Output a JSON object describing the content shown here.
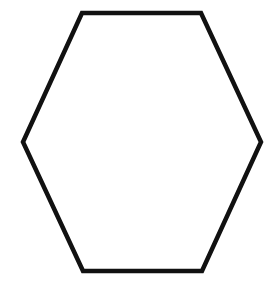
{
  "diagram": {
    "shape": "hexagon",
    "orientation": "flat-top",
    "stroke_color": "#111111",
    "fill_color": "#ffffff",
    "background_color": "#ffffff",
    "stroke_width": 4.5,
    "vertices": [
      [
        82,
        13
      ],
      [
        201,
        13
      ],
      [
        261,
        142
      ],
      [
        202,
        271
      ],
      [
        83,
        271
      ],
      [
        23,
        142
      ]
    ]
  }
}
